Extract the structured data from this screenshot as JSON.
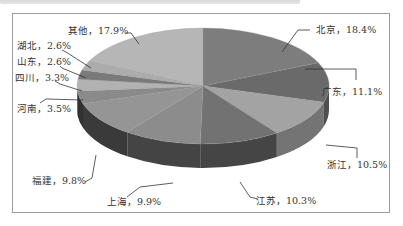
{
  "chart_data": {
    "type": "pie",
    "style": "3d",
    "title": "",
    "categories": [
      "北京",
      "广东",
      "浙江",
      "江苏",
      "上海",
      "福建",
      "河南",
      "四川",
      "山东",
      "湖北",
      "其他"
    ],
    "values": [
      18.4,
      11.1,
      10.5,
      10.3,
      9.9,
      9.8,
      3.5,
      3.3,
      2.6,
      2.6,
      17.9
    ],
    "unit": "%",
    "labels": [
      "北京，18.4%",
      "广东，11.1%",
      "浙江，10.5%",
      "江苏，10.3%",
      "上海，9.9%",
      "福建，9.8%",
      "河南，3.5%",
      "四川，3.3%",
      "山东，2.6%",
      "湖北，2.6%",
      "其他，17.9%"
    ],
    "colors": [
      "#7d7d7d",
      "#6a6a6a",
      "#a3a3a3",
      "#727272",
      "#8c8c8c",
      "#959595",
      "#8a8a8a",
      "#b2b2b2",
      "#7a7a7a",
      "#acacac",
      "#b6b6b6"
    ],
    "legend": "none (data labels with leader lines)"
  }
}
